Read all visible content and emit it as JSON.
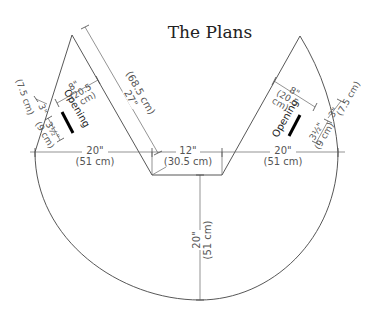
{
  "title": "The Plans",
  "diagram": {
    "type": "sewing-pattern",
    "left_piece": {
      "side_length": {
        "in": "27\"",
        "cm": "(68.5 cm)"
      },
      "opening_from_apex": {
        "in": "8\"",
        "cm_a": "(20.5",
        "cm_b": "cm)"
      },
      "opening_length": {
        "in": "3½\"",
        "cm": "(9 cm)"
      },
      "edge_offset": {
        "in": "3\"",
        "cm": "(7.5 cm)"
      },
      "opening_label": "Opening"
    },
    "right_piece": {
      "opening_from_apex": {
        "in": "8\"",
        "cm_a": "(20.5",
        "cm_b": "cm)"
      },
      "opening_length": {
        "in": "3½\"",
        "cm": "(9 cm)"
      },
      "edge_offset": {
        "in": "3\"",
        "cm": "(7.5 cm)"
      },
      "opening_label": "Opening"
    },
    "horizontal_dimensions": {
      "left": {
        "in": "20\"",
        "cm": "(51 cm)"
      },
      "center": {
        "in": "12\"",
        "cm": "(30.5 cm)"
      },
      "right": {
        "in": "20\"",
        "cm": "(51 cm)"
      }
    },
    "vertical_dimension": {
      "in": "20\"",
      "cm": "(51 cm)"
    },
    "colors": {
      "line": "#444444",
      "text": "#555555",
      "opening": "#000000",
      "background": "#ffffff"
    }
  }
}
